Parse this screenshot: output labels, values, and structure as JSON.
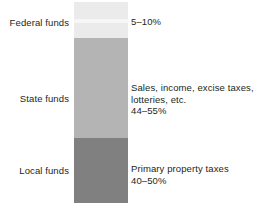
{
  "chart_data": {
    "type": "bar",
    "orientation": "vertical-stacked",
    "title": "",
    "subtitle": "",
    "xlabel": "",
    "ylabel": "",
    "grid": false,
    "legend": "none",
    "axis_visible": false,
    "units": "percent of total funding",
    "ylim": [
      0,
      100
    ],
    "categories": [
      "Federal funds",
      "State funds",
      "Local funds"
    ],
    "values": [
      7.5,
      49.5,
      45.0
    ],
    "segments": [
      {
        "category": "Federal funds",
        "label": "Federal funds",
        "range_label": "5–10%",
        "range_min": 5,
        "range_max": 10,
        "value": 7.5,
        "description": "",
        "color": "#ebebeb"
      },
      {
        "category": "State funds",
        "label": "State funds",
        "range_label": "44–55%",
        "range_min": 44,
        "range_max": 55,
        "value": 49.5,
        "description_line1": "Sales, income, excise taxes,",
        "description_line2": "lotteries, etc.",
        "color": "#b4b4b4"
      },
      {
        "category": "Local funds",
        "label": "Local funds",
        "range_label": "40–50%",
        "range_min": 40,
        "range_max": 50,
        "value": 45.0,
        "description_line1": "Primary property taxes",
        "color": "#808080"
      }
    ],
    "colors": {
      "federal": "#ebebeb",
      "state": "#b4b4b4",
      "local": "#808080",
      "background": "#ffffff",
      "text": "#231f20"
    }
  }
}
